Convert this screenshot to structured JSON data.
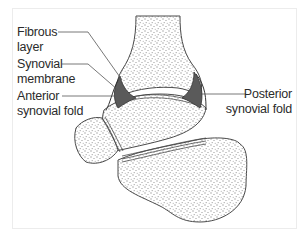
{
  "diagram": {
    "labels": [
      {
        "id": "fibrous-layer",
        "line1": "Fibrous",
        "line2": "layer"
      },
      {
        "id": "synovial-membrane",
        "line1": "Synovial",
        "line2": "membrane"
      },
      {
        "id": "anterior-synovial-fold",
        "line1": "Anterior",
        "line2": "synovial fold"
      },
      {
        "id": "posterior-synovial-fold",
        "line1": "Posterior",
        "line2": "synovial fold"
      }
    ],
    "colors": {
      "bone_outline": "#4a4a4a",
      "bone_stipple": "#9a9a9a",
      "synovial_fill": "#5a5a5a",
      "leader_line": "#555555",
      "frame_border": "#ececec"
    }
  }
}
